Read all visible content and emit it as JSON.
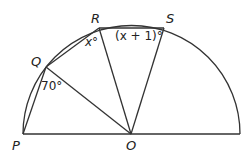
{
  "diagram": {
    "type": "semicircle-geometry",
    "center_label": "O",
    "points": {
      "P": {
        "label": "P",
        "x": 23,
        "y": 134
      },
      "Q": {
        "label": "Q",
        "x": 46,
        "y": 67
      },
      "R": {
        "label": "R",
        "x": 99,
        "y": 28
      },
      "S": {
        "label": "S",
        "x": 164,
        "y": 28
      },
      "O": {
        "label": "O",
        "x": 131,
        "y": 134
      },
      "E": {
        "x": 240,
        "y": 134
      }
    },
    "angles": {
      "PQO": "70°",
      "QRO": "x°",
      "RSO": "(x + 1)°"
    },
    "segments": [
      "PE",
      "PQ",
      "QR",
      "RS",
      "QO",
      "RO",
      "SO"
    ]
  }
}
